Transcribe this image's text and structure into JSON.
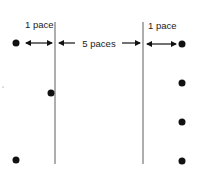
{
  "diagram": {
    "labels": {
      "left_spacing": "1 pace",
      "center_spacing": "5 paces",
      "right_spacing": "1 pace"
    },
    "colors": {
      "dot": "#111111",
      "line": "#777777",
      "arrow": "#111111",
      "text": "#222222"
    },
    "lines": [
      {
        "name": "left-boundary-line",
        "x": 55,
        "y1": 22,
        "y2": 164
      },
      {
        "name": "right-boundary-line",
        "x": 143,
        "y1": 22,
        "y2": 164
      }
    ],
    "left_dots": [
      {
        "x": 16,
        "y": 43
      },
      {
        "x": 51,
        "y": 93
      },
      {
        "x": 16,
        "y": 160
      }
    ],
    "right_dots": [
      {
        "x": 182,
        "y": 44
      },
      {
        "x": 182,
        "y": 83
      },
      {
        "x": 182,
        "y": 122
      },
      {
        "x": 182,
        "y": 161
      }
    ]
  }
}
